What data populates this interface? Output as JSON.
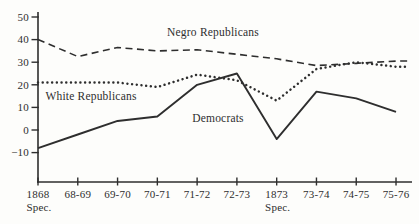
{
  "chart_data": {
    "type": "line",
    "title": "",
    "xlabel": "",
    "ylabel": "",
    "ylim": [
      -10,
      50
    ],
    "grid": false,
    "legend": "inline-annotations",
    "y_ticks": [
      50,
      40,
      30,
      20,
      10,
      0,
      -10
    ],
    "x_ticks": [
      {
        "label": "1868",
        "sublabel": "Spec."
      },
      {
        "label": "68-69",
        "sublabel": ""
      },
      {
        "label": "69-70",
        "sublabel": ""
      },
      {
        "label": "70-71",
        "sublabel": ""
      },
      {
        "label": "71-72",
        "sublabel": ""
      },
      {
        "label": "72-73",
        "sublabel": ""
      },
      {
        "label": "1873",
        "sublabel": "Spec."
      },
      {
        "label": "73-74",
        "sublabel": ""
      },
      {
        "label": "74-75",
        "sublabel": ""
      },
      {
        "label": "75-76",
        "sublabel": ""
      }
    ],
    "series": [
      {
        "name": "Negro Republicans",
        "line_style": "dashed",
        "values": [
          40,
          32.5,
          36.5,
          35,
          35.5,
          33.5,
          31.5,
          28.5,
          29.5,
          30.5
        ]
      },
      {
        "name": "White Republicans",
        "line_style": "dotted",
        "values": [
          21,
          21,
          21,
          19,
          24.5,
          22,
          13,
          27,
          30,
          28
        ]
      },
      {
        "name": "Democrats",
        "line_style": "solid",
        "values": [
          -8,
          -2,
          4,
          6,
          20,
          25,
          -4,
          17,
          14,
          8
        ]
      }
    ],
    "annotations": [
      {
        "text": "Negro Republicans",
        "x_px": 213,
        "baseline_px": 36
      },
      {
        "text": "White Republicans",
        "x_px": 91,
        "baseline_px": 100
      },
      {
        "text": "Democrats",
        "x_px": 218,
        "baseline_px": 122
      }
    ],
    "colors": {
      "ink": "#2e2e2e",
      "paper": "#fdfdfb"
    }
  }
}
